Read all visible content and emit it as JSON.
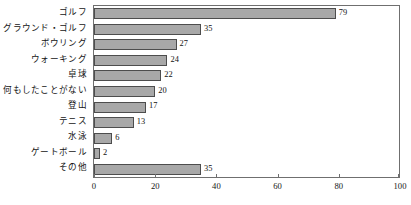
{
  "chart_data": {
    "type": "bar",
    "orientation": "horizontal",
    "title": "",
    "xlabel": "",
    "ylabel": "",
    "xlim": [
      0,
      100
    ],
    "xticks": [
      0,
      20,
      40,
      60,
      80,
      100
    ],
    "grid": false,
    "legend": null,
    "bar_color": "#a8a8a8",
    "bar_edge_color": "#4d4d4d",
    "categories": [
      "ゴルフ",
      "グラウンド・ゴルフ",
      "ボウリング",
      "ウォーキング",
      "卓球",
      "何もしたことがない",
      "登山",
      "テニス",
      "水泳",
      "ゲートボール",
      "その他"
    ],
    "values": [
      79,
      35,
      27,
      24,
      22,
      20,
      17,
      13,
      6,
      2,
      35
    ],
    "value_labels": [
      "79",
      "35",
      "27",
      "24",
      "22",
      "20",
      "17",
      "13",
      "6",
      "2",
      "35"
    ],
    "xtick_labels": [
      "0",
      "20",
      "40",
      "60",
      "80",
      "100"
    ]
  }
}
